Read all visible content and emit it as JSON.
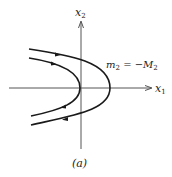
{
  "figure": {
    "caption": "(a)",
    "axes": {
      "x_label": "x",
      "x_label_sub": "1",
      "y_label": "x",
      "y_label_sub": "2"
    },
    "annotation": {
      "lhs": "m",
      "lhs_sub": "2",
      "eq": " = −",
      "rhs": "M",
      "rhs_sub": "2"
    },
    "trajectories": [
      {
        "name": "inner",
        "direction": "top-left to vertex to bottom-left"
      },
      {
        "name": "outer",
        "direction": "top-left to vertex to bottom-left"
      }
    ]
  }
}
